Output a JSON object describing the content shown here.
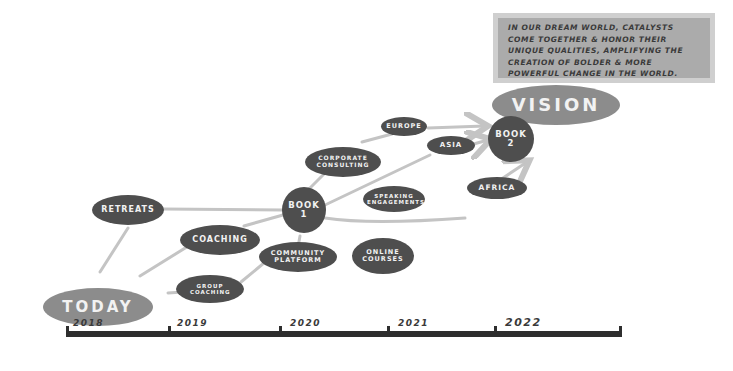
{
  "vision_statement": "In our dream world, catalysts come together & honor their unique qualities, amplifying the creation of bolder & more powerful change in the world.",
  "nodes": {
    "vision": "Vision",
    "book2": "Book 2",
    "europe": "Europe",
    "asia": "Asia",
    "africa": "Africa",
    "corporate_consulting": "Corporate Consulting",
    "speaking_engagements": "Speaking Engagements",
    "book1": "Book 1",
    "retreats": "Retreats",
    "coaching": "Coaching",
    "community_platform": "Community Platform",
    "online_courses": "Online Courses",
    "group_coaching": "Group Coaching",
    "today": "Today"
  },
  "timeline": {
    "years": [
      "2018",
      "2019",
      "2020",
      "2021",
      "2022"
    ]
  },
  "colors": {
    "node_dark": "#4e4e4e",
    "node_light": "#8c8c8c",
    "connector": "#c4c4c4",
    "axis": "#2e2e2e"
  }
}
